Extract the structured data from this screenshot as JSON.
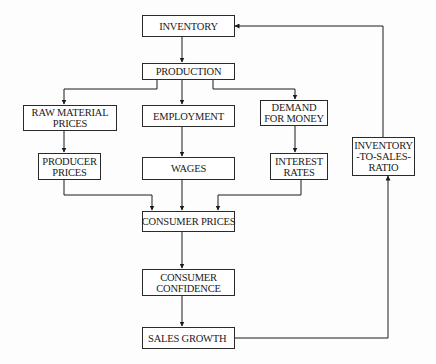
{
  "diagram": {
    "type": "flowchart",
    "nodes": [
      {
        "id": "inventory",
        "lines": [
          "INVENTORY"
        ]
      },
      {
        "id": "production",
        "lines": [
          "PRODUCTION"
        ]
      },
      {
        "id": "raw_material_prices",
        "lines": [
          "RAW MATERIAL",
          "PRICES"
        ]
      },
      {
        "id": "employment",
        "lines": [
          "EMPLOYMENT"
        ]
      },
      {
        "id": "demand_for_money",
        "lines": [
          "DEMAND",
          "FOR MONEY"
        ]
      },
      {
        "id": "producer_prices",
        "lines": [
          "PRODUCER",
          "PRICES"
        ]
      },
      {
        "id": "wages",
        "lines": [
          "WAGES"
        ]
      },
      {
        "id": "interest_rates",
        "lines": [
          "INTEREST",
          "RATES"
        ]
      },
      {
        "id": "inventory_to_sales_ratio",
        "lines": [
          "INVENTORY",
          "-TO-SALES-",
          "RATIO"
        ]
      },
      {
        "id": "consumer_prices",
        "lines": [
          "CONSUMER PRICES"
        ]
      },
      {
        "id": "consumer_confidence",
        "lines": [
          "CONSUMER",
          "CONFIDENCE"
        ]
      },
      {
        "id": "sales_growth",
        "lines": [
          "SALES GROWTH"
        ]
      }
    ],
    "edges": [
      {
        "from": "inventory",
        "to": "production"
      },
      {
        "from": "production",
        "to": "raw_material_prices"
      },
      {
        "from": "production",
        "to": "employment"
      },
      {
        "from": "production",
        "to": "demand_for_money"
      },
      {
        "from": "raw_material_prices",
        "to": "producer_prices"
      },
      {
        "from": "employment",
        "to": "wages"
      },
      {
        "from": "demand_for_money",
        "to": "interest_rates"
      },
      {
        "from": "producer_prices",
        "to": "consumer_prices"
      },
      {
        "from": "wages",
        "to": "consumer_prices"
      },
      {
        "from": "interest_rates",
        "to": "consumer_prices"
      },
      {
        "from": "consumer_prices",
        "to": "consumer_confidence"
      },
      {
        "from": "consumer_confidence",
        "to": "sales_growth"
      },
      {
        "from": "sales_growth",
        "to": "inventory_to_sales_ratio"
      },
      {
        "from": "inventory_to_sales_ratio",
        "to": "inventory"
      }
    ]
  }
}
